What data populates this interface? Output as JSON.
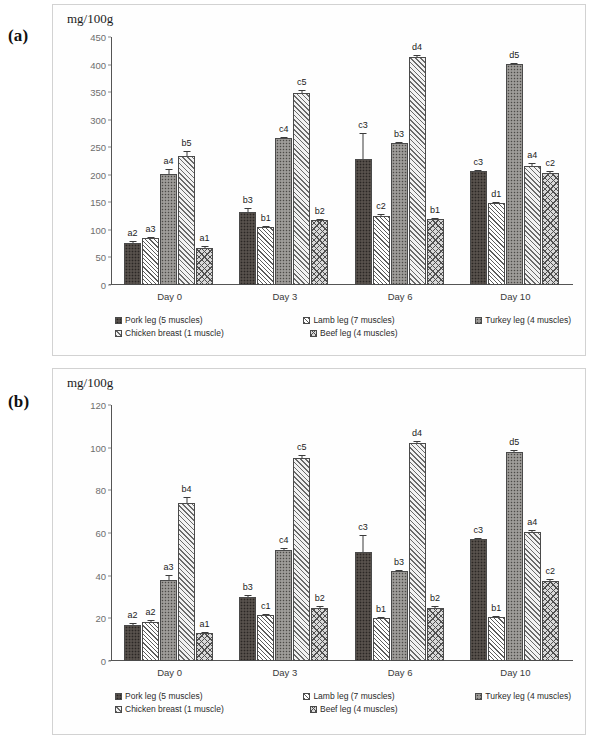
{
  "figure": {
    "panel_a_label": "(a)",
    "panel_b_label": "(b)"
  },
  "chart_data": [
    {
      "panel": "(a)",
      "type": "bar",
      "title": "",
      "ylabel": "mg/100g",
      "xlabel": "",
      "ylim": [
        0,
        450
      ],
      "yticks": [
        0,
        50,
        100,
        150,
        200,
        250,
        300,
        350,
        400,
        450
      ],
      "categories": [
        "Day 0",
        "Day 3",
        "Day 6",
        "Day 10"
      ],
      "grid": false,
      "legend_position": "bottom",
      "series": [
        {
          "name": "Pork leg (5 muscles)",
          "pattern": "dark-dotted",
          "values": [
            77,
            133,
            229,
            207
          ],
          "errors": [
            3,
            6,
            46,
            2
          ],
          "labels": [
            "a2",
            "b3",
            "c3",
            "c3"
          ]
        },
        {
          "name": "Lamb leg (7 muscles)",
          "pattern": "light-diagonal-hatch",
          "values": [
            86,
            105,
            126,
            148
          ],
          "errors": [
            2,
            2,
            2,
            2
          ],
          "labels": [
            "a3",
            "b1",
            "c2",
            "d1"
          ]
        },
        {
          "name": "Turkey leg (4 muscles)",
          "pattern": "grey-speckle",
          "values": [
            201,
            266,
            257,
            401
          ],
          "errors": [
            9,
            3,
            2,
            2
          ],
          "labels": [
            "a4",
            "c4",
            "b3",
            "d5"
          ]
        },
        {
          "name": "Chicken breast (1 muscle)",
          "pattern": "diagonal-hatch",
          "values": [
            235,
            349,
            414,
            216
          ],
          "errors": [
            8,
            5,
            4,
            5
          ],
          "labels": [
            "b5",
            "c5",
            "d4",
            "a4"
          ]
        },
        {
          "name": "Beef leg (4 muscles)",
          "pattern": "crosshatch",
          "values": [
            68,
            118,
            119,
            204
          ],
          "errors": [
            2,
            2,
            2,
            2
          ],
          "labels": [
            "a1",
            "b2",
            "b1",
            "c2"
          ]
        }
      ]
    },
    {
      "panel": "(b)",
      "type": "bar",
      "title": "",
      "ylabel": "mg/100g",
      "xlabel": "",
      "ylim": [
        0,
        120
      ],
      "yticks": [
        0,
        20,
        40,
        60,
        80,
        100,
        120
      ],
      "categories": [
        "Day 0",
        "Day 3",
        "Day 6",
        "Day 10"
      ],
      "grid": false,
      "legend_position": "bottom",
      "series": [
        {
          "name": "Pork leg (5 muscles)",
          "pattern": "dark-dotted",
          "values": [
            17,
            30,
            51,
            57
          ],
          "errors": [
            0.8,
            0.8,
            8,
            0.8
          ],
          "labels": [
            "a2",
            "b3",
            "c3",
            "c3"
          ]
        },
        {
          "name": "Lamb leg (7 muscles)",
          "pattern": "light-diagonal-hatch",
          "values": [
            18.5,
            21.5,
            20,
            20.5
          ],
          "errors": [
            0.6,
            0.6,
            0.8,
            0.6
          ],
          "labels": [
            "a2",
            "c1",
            "b1",
            "b1"
          ]
        },
        {
          "name": "Turkey leg (4 muscles)",
          "pattern": "grey-speckle",
          "values": [
            38,
            52,
            42,
            98
          ],
          "errors": [
            2.5,
            0.8,
            0.8,
            0.8
          ],
          "labels": [
            "a3",
            "c4",
            "b3",
            "d5"
          ]
        },
        {
          "name": "Chicken breast (1 muscle)",
          "pattern": "diagonal-hatch",
          "values": [
            74,
            95,
            102,
            60.5
          ],
          "errors": [
            3,
            1.5,
            1.2,
            1
          ],
          "labels": [
            "b4",
            "c5",
            "d4",
            "a4"
          ]
        },
        {
          "name": "Beef leg (4 muscles)",
          "pattern": "crosshatch",
          "values": [
            13,
            25,
            25,
            37.5
          ],
          "errors": [
            0.6,
            0.6,
            0.6,
            1
          ],
          "labels": [
            "a1",
            "b2",
            "b2",
            "c2"
          ]
        }
      ]
    }
  ]
}
